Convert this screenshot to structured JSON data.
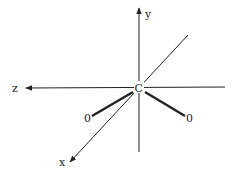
{
  "diagram": {
    "axes": {
      "x_label": "x",
      "y_label": "y",
      "z_label": "z"
    },
    "atoms": {
      "center": "C",
      "left_oxygen": "0",
      "right_oxygen": "0"
    },
    "colors": {
      "line": "#222222",
      "background": "#ffffff"
    }
  }
}
